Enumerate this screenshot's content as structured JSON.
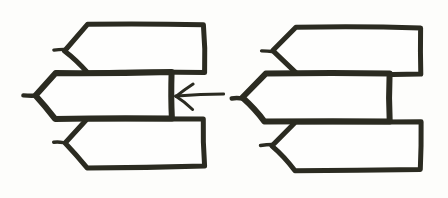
{
  "image": {
    "title": "Hand-drawn diagram of three overlapping pointed banner shapes, shown twice",
    "width": 448,
    "height": 198,
    "background_color": "#fdfdfb",
    "ink_color": "#2b2b21",
    "style": "hand-drawn pen sketch"
  },
  "figures": [
    {
      "id": "left-figure",
      "label": "Left figure",
      "has_annotation_arrow": true,
      "shapes": [
        {
          "id": "left-top-banner",
          "label": "Top banner",
          "point_direction": "left",
          "body": {
            "x": 88,
            "y": 25,
            "width": 116,
            "height": 47
          },
          "tip": {
            "x": 64,
            "y": 50
          },
          "stub_end": {
            "x": 54,
            "y": 50
          },
          "stroke_width": 5
        },
        {
          "id": "left-middle-banner",
          "label": "Middle banner",
          "point_direction": "left",
          "body": {
            "x": 55,
            "y": 72,
            "width": 117,
            "height": 47
          },
          "tip": {
            "x": 36,
            "y": 96
          },
          "stub_end": {
            "x": 23,
            "y": 96
          },
          "stroke_width": 6
        },
        {
          "id": "left-bottom-banner",
          "label": "Bottom banner",
          "point_direction": "left",
          "body": {
            "x": 88,
            "y": 119,
            "width": 116,
            "height": 48
          },
          "tip": {
            "x": 64,
            "y": 142
          },
          "stub_end": {
            "x": 54,
            "y": 142
          },
          "stroke_width": 5
        }
      ],
      "annotation_arrow": {
        "id": "left-pointing-arrow",
        "label": "Left-pointing arrow",
        "tip": {
          "x": 176,
          "y": 96
        },
        "tail": {
          "x": 224,
          "y": 94
        },
        "head_length": 17,
        "stroke_width": 3
      }
    },
    {
      "id": "right-figure",
      "label": "Right figure",
      "has_annotation_arrow": false,
      "shapes": [
        {
          "id": "right-top-banner",
          "label": "Top banner",
          "point_direction": "left",
          "body": {
            "x": 296,
            "y": 27,
            "width": 124,
            "height": 47
          },
          "tip": {
            "x": 272,
            "y": 51
          },
          "stub_end": {
            "x": 261,
            "y": 51
          },
          "stroke_width": 5
        },
        {
          "id": "right-middle-banner",
          "label": "Middle banner",
          "point_direction": "left",
          "body": {
            "x": 265,
            "y": 74,
            "width": 125,
            "height": 48
          },
          "tip": {
            "x": 243,
            "y": 98
          },
          "stub_end": {
            "x": 231,
            "y": 98
          },
          "stroke_width": 6
        },
        {
          "id": "right-bottom-banner",
          "label": "Bottom banner",
          "point_direction": "left",
          "body": {
            "x": 296,
            "y": 122,
            "width": 124,
            "height": 48
          },
          "tip": {
            "x": 272,
            "y": 145
          },
          "stub_end": {
            "x": 261,
            "y": 145
          },
          "stroke_width": 5
        }
      ],
      "annotation_arrow": null
    }
  ]
}
